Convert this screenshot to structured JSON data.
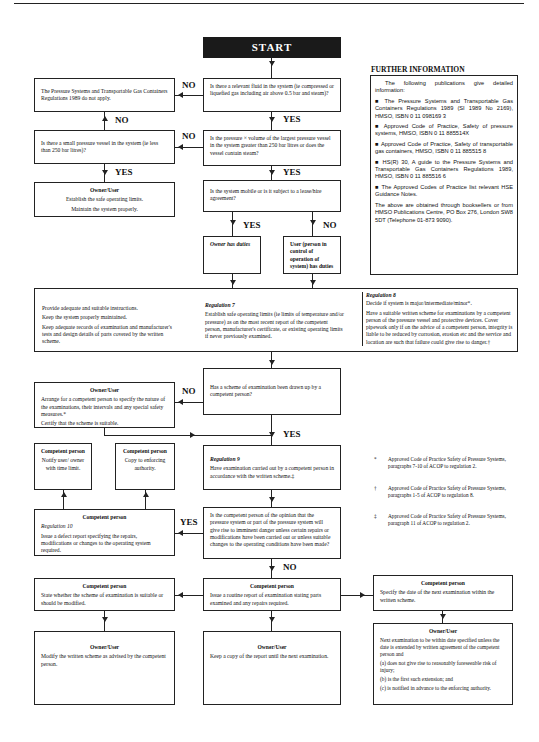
{
  "start": {
    "label": "START"
  },
  "labels": {
    "yes": "YES",
    "no": "NO"
  },
  "nodes": {
    "not_apply": "The Pressure Systems and Transportable Gas Containers Regulations 1989 do not apply.",
    "q_fluid": "Is there a relevant fluid in the system (ie compressed or liquefied gas including air above 0.5 bar and steam)?",
    "q_small_vessel": "Is there a small pressure vessel in the system (ie less than 250 bar litres)?",
    "q_pv": "Is the pressure × volume of the largest pressure vessel in the system greater than 250 bar litres or does the vessel contain steam?",
    "owner_small": {
      "title": "Owner/User",
      "lines": [
        "Establish the safe operating limits.",
        "Maintain the system properly."
      ]
    },
    "q_mobile": "Is the system mobile or is it subject to a lease/hire agreement?",
    "owner_duties": "Owner has duties",
    "user_duties": "User (person in control of operation of system) has duties",
    "general_duties": [
      "Provide adequate and suitable instructions.",
      "Keep the system properly maintained.",
      "Keep adequate records of examination and manufacturer's tests and design details of parts covered by the written scheme."
    ],
    "reg7": {
      "title": "Regulation 7",
      "text": "Establish safe operating limits (ie limits of temperature and/or pressure) as on the most recent report of the competent person, manufacturer's certificate, or existing operating limits if never previously examined."
    },
    "reg8": {
      "title": "Regulation 8",
      "lines": [
        "Decide if system is major/intermediate/minor*.",
        "Have a suitable written scheme for examinations by a competent person of the pressure vessel and protective devices. Cover pipework only if on the advice of a competent person, integrity is liable to be reduced by corrosion, erosion etc and the service and location are such that failure could give rise to danger.†"
      ]
    },
    "owner_arrange": {
      "title": "Owner/User",
      "lines": [
        "Arrange for a competent person to specify the nature of the examinations, their intervals and any special safety measures.*",
        "Certify that the scheme is suitable."
      ]
    },
    "q_scheme": "Has a scheme of examination been drawn up by a competent person?",
    "cp_notify": {
      "title": "Competent person",
      "text": "Notify user/ owner with time limit."
    },
    "cp_copy": {
      "title": "Competent person",
      "text": "Copy to enforcing authority."
    },
    "reg9": {
      "title": "Regulation 9",
      "text": "Have examination carried out by a competent person in accordance with the written scheme.‡"
    },
    "cp_defect": {
      "title": "Competent person",
      "reg": "Regulation 10",
      "text": "Issue a defect report specifying the repairs, modifications or changes to the operating system required."
    },
    "q_danger": "Is the competent person of the opinion that the pressure system or part of the pressure system will give rise to imminent danger unless certain repairs or modifications have been carried out or unless suitable changes to the operating conditions have been made?",
    "cp_state": {
      "title": "Competent person",
      "text": "State whether the scheme of examination is suitable or should be modified."
    },
    "cp_routine": {
      "title": "Competent person",
      "text": "Issue a routine report of examination stating parts examined and any repairs required."
    },
    "cp_date": {
      "title": "Competent person",
      "text": "Specify the date of the next examination within the written scheme."
    },
    "owner_modify": {
      "title": "Owner/User",
      "text": "Modify the written scheme as advised by the competent person."
    },
    "owner_keep": {
      "title": "Owner/User",
      "text": "Keep a copy of the report until the next examination."
    },
    "owner_next": {
      "title": "Owner/User",
      "text": "Next examination to be within date specified unless the date is extended by written agreement of the competent person and",
      "items": [
        "(a) does not give rise to reasonably foreseeable risk of injury;",
        "(b) is the first such extension; and",
        "(c) is notified in advance to the enforcing authority."
      ]
    }
  },
  "further_info": {
    "heading": "FURTHER INFORMATION",
    "intro": "The following publications give detailed information:",
    "items": [
      "■ The Pressure Systems and Transportable Gas Containers Regulations 1989 (SI 1989 No 2169), HMSO, ISBN 0 11 098169 3",
      "■ Approved Code of Practice, Safety of pressure systems, HMSO, ISBN 0 11 885514X",
      "■ Approved Code of Practice, Safety of transportable gas containers, HMSO, ISBN 0 11 885515 8",
      "■ HS(R) 30, A guide to the Pressure Systems and Transportable Gas Containers Regulations 1989, HMSO, ISBN 0 11 885516 6",
      "■ The Approved Codes of Practice list relevant HSE Guidance Notes."
    ],
    "footer": "The above are obtained through booksellers or from HMSO Publications Centre, PO Box 276, London SW8 5DT (Telephone 01-873 9090)."
  },
  "footnotes": [
    {
      "symbol": "*",
      "text": "Approved Code of Practice Safety of Pressure Systems, paragraphs 7-10 of ACOP to regulation 2."
    },
    {
      "symbol": "†",
      "text": "Approved Code of Practice Safety of Pressure Systems, paragraphs 1-5 of ACOP to regulation 8."
    },
    {
      "symbol": "‡",
      "text": "Approved Code of Practice Safety of Pressure Systems, paragraph 11 of ACOP to regulation 2."
    }
  ]
}
